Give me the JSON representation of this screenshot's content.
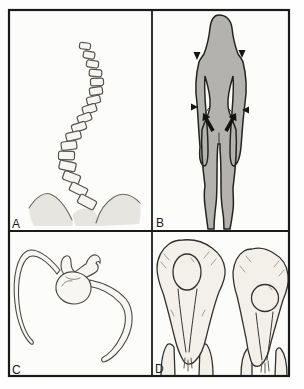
{
  "figure": {
    "panels": [
      {
        "label": "A"
      },
      {
        "label": "B"
      },
      {
        "label": "C"
      },
      {
        "label": "D"
      }
    ],
    "colors": {
      "panel_background": "#fcfcfa",
      "frame": "#1b1b1b",
      "silhouette_fill": "#b3b2af",
      "bone_fill": "#f7f6f2",
      "shade_fill": "#e6e5e0",
      "flesh_fill": "#f2f0e9",
      "marker": "#141414"
    }
  }
}
